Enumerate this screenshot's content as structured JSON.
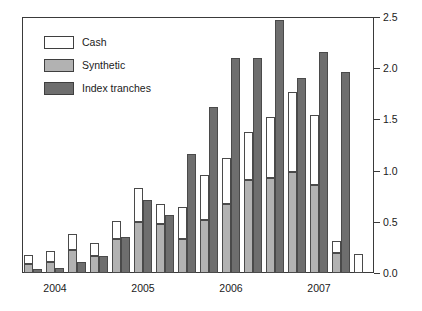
{
  "chart_data": {
    "type": "bar",
    "title": "",
    "subtitle": "",
    "xlabel": "",
    "ylabel": "",
    "ylim": [
      0.0,
      2.5
    ],
    "yticks": [
      0.0,
      0.5,
      1.0,
      1.5,
      2.0,
      2.5
    ],
    "ytick_labels": [
      "0.0",
      "0.5",
      "1.0",
      "1.5",
      "2.0",
      "2.5"
    ],
    "ytick_side": "right",
    "grid": false,
    "legend_position": "upper-left",
    "bar_mode": "grouped-with-stack",
    "stack_order": [
      "Synthetic",
      "Cash"
    ],
    "categories": [
      "2004 Q1",
      "2004 Q2",
      "2004 Q3",
      "2004 Q4",
      "2005 Q1",
      "2005 Q2",
      "2005 Q3",
      "2005 Q4",
      "2006 Q1",
      "2006 Q2",
      "2006 Q3",
      "2006 Q4",
      "2007 Q1",
      "2007 Q2",
      "2007 Q3",
      "2007 Q4"
    ],
    "xtick_labels": [
      "2004",
      "2005",
      "2006",
      "2007"
    ],
    "xtick_categories": [
      "2004 Q2",
      "2005 Q2",
      "2006 Q2",
      "2007 Q2"
    ],
    "series": [
      {
        "name": "Cash",
        "color": "#ffffff",
        "values": [
          0.09,
          0.11,
          0.16,
          0.12,
          0.18,
          0.33,
          0.19,
          0.31,
          0.44,
          0.45,
          0.47,
          0.59,
          0.78,
          0.68,
          0.11,
          0.19
        ]
      },
      {
        "name": "Synthetic",
        "color": "#b2b2b2",
        "values": [
          0.09,
          0.11,
          0.22,
          0.17,
          0.33,
          0.5,
          0.48,
          0.33,
          0.52,
          0.67,
          0.91,
          0.93,
          0.99,
          0.86,
          0.2,
          0.0
        ]
      },
      {
        "name": "Index tranches",
        "color": "#6e6e6e",
        "values": [
          0.04,
          0.05,
          0.11,
          0.17,
          0.35,
          0.71,
          0.57,
          1.16,
          1.62,
          2.1,
          2.1,
          2.47,
          1.9,
          2.16,
          1.96,
          0.0
        ]
      }
    ]
  },
  "legend": {
    "items": [
      {
        "label": "Cash",
        "swatch": "cash-swatch"
      },
      {
        "label": "Synthetic",
        "swatch": "synthetic-swatch"
      },
      {
        "label": "Index tranches",
        "swatch": "index-tranches-swatch"
      }
    ]
  },
  "axes": {
    "y_labels": [
      "2.5",
      "2.0",
      "1.5",
      "1.0",
      "0.5",
      "0.0"
    ],
    "x_labels": [
      "2004",
      "2005",
      "2006",
      "2007"
    ]
  },
  "colors": {
    "cash": "#ffffff",
    "synthetic": "#b2b2b2",
    "index_tranches": "#6e6e6e",
    "outline": "#4a4a4a",
    "axis": "#3a3a3a",
    "text": "#1a1a1a",
    "background": "#ffffff"
  }
}
